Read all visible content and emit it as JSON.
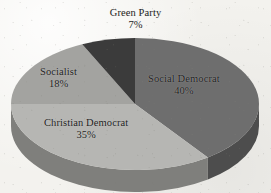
{
  "chart_data": {
    "type": "pie",
    "title": "",
    "subtitle": "",
    "xlabel": "",
    "ylabel": "",
    "legend_position": "none",
    "grid": false,
    "three_d": true,
    "start_angle_deg": 0,
    "direction": "clockwise",
    "unit": "%",
    "categories": [
      "Social Democrat",
      "Christian Democrat",
      "Socialist",
      "Green Party"
    ],
    "values": [
      40,
      35,
      18,
      7
    ],
    "labels": [
      "40%",
      "35%",
      "18%",
      "7%"
    ],
    "colors": [
      "#6e6e6e",
      "#b6b6b3",
      "#a3a3a0",
      "#3b3b3b"
    ],
    "side_colors": [
      "#4d4d4d",
      "#7f7f7c",
      "#747471",
      "#2a2a2a"
    ],
    "slices": [
      {
        "name": "Social Democrat",
        "value": 40,
        "label": "40%",
        "color": "#6e6e6e"
      },
      {
        "name": "Christian Democrat",
        "value": 35,
        "label": "35%",
        "color": "#b6b6b3"
      },
      {
        "name": "Socialist",
        "value": 18,
        "label": "18%",
        "color": "#a3a3a0"
      },
      {
        "name": "Green Party",
        "value": 7,
        "label": "7%",
        "color": "#3b3b3b"
      }
    ]
  },
  "labels": {
    "green_party": {
      "name": "Green Party",
      "percent": "7%"
    },
    "social_democrat": {
      "name": "Social Democrat",
      "percent": "40%"
    },
    "socialist": {
      "name": "Socialist",
      "percent": "18%"
    },
    "christian_democrat": {
      "name": "Christian Democrat",
      "percent": "35%"
    }
  },
  "colors": {
    "background": "#f3f2ee",
    "text": "#1c1c1c",
    "social_democrat": "#6e6e6e",
    "christian_democrat": "#b6b6b3",
    "socialist": "#a3a3a0",
    "green_party": "#3b3b3b"
  }
}
